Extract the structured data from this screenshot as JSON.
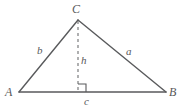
{
  "figure": {
    "kind": "triangle-with-altitude",
    "background_color": "#ffffff",
    "stroke_color": "#595a5c",
    "label_color": "#58585a",
    "vertices": {
      "A": {
        "label": "A",
        "x": 19,
        "y": 92
      },
      "B": {
        "label": "B",
        "x": 166,
        "y": 92
      },
      "C": {
        "label": "C",
        "x": 78,
        "y": 20
      }
    },
    "altitude": {
      "label": "h",
      "from_x": 78,
      "from_y": 20,
      "foot_x": 78,
      "foot_y": 92,
      "style": "dashed"
    },
    "right_angle": {
      "present": true,
      "x": 78,
      "y": 92,
      "size": 8
    },
    "sides": {
      "a": {
        "label": "a",
        "description": "side-CB"
      },
      "b": {
        "label": "b",
        "description": "side-AC"
      },
      "c": {
        "label": "c",
        "description": "base-AB"
      }
    }
  }
}
